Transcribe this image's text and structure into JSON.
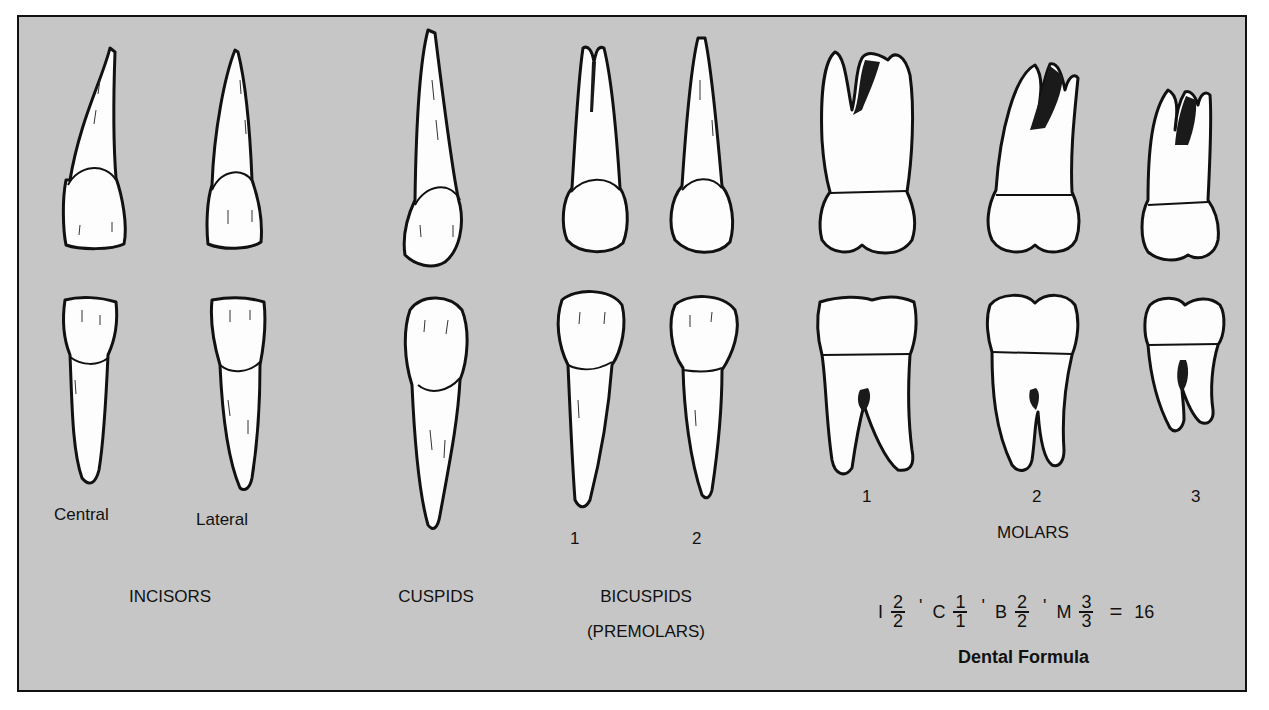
{
  "figure": {
    "groups": [
      {
        "name": "incisors",
        "label": "INCISORS",
        "teeth": [
          {
            "label": "Central"
          },
          {
            "label": "Lateral"
          }
        ]
      },
      {
        "name": "cuspids",
        "label": "CUSPIDS",
        "teeth": [
          {
            "label": ""
          }
        ]
      },
      {
        "name": "bicuspids",
        "label": "BICUSPIDS",
        "sublabel": "(PREMOLARS)",
        "teeth": [
          {
            "label": "1"
          },
          {
            "label": "2"
          }
        ]
      },
      {
        "name": "molars",
        "label": "MOLARS",
        "teeth": [
          {
            "label": "1"
          },
          {
            "label": "2"
          },
          {
            "label": "3"
          }
        ]
      }
    ],
    "dental_formula": {
      "terms": [
        {
          "letter": "I",
          "upper": "2",
          "lower": "2"
        },
        {
          "letter": "C",
          "upper": "1",
          "lower": "1"
        },
        {
          "letter": "B",
          "upper": "2",
          "lower": "2"
        },
        {
          "letter": "M",
          "upper": "3",
          "lower": "3"
        }
      ],
      "separator": "'",
      "equals": "=",
      "total": "16",
      "title": "Dental Formula"
    },
    "colors": {
      "background": "#c6c6c6",
      "outline": "#111111",
      "tooth": "#fdfdfd"
    }
  }
}
